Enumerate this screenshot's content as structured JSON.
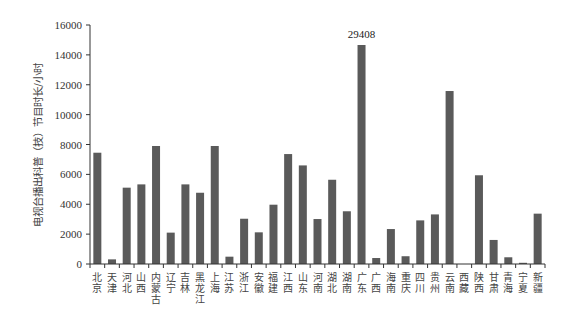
{
  "chart_data": {
    "type": "bar",
    "title": "",
    "xlabel": "",
    "ylabel": "电视台播出科普（技）节目时长/小时",
    "ylim": [
      0,
      16000
    ],
    "yticks": [
      0,
      2000,
      4000,
      6000,
      8000,
      10000,
      12000,
      14000,
      16000
    ],
    "grid": false,
    "legend": null,
    "categories": [
      "北京",
      "天津",
      "河北",
      "山西",
      "内蒙古",
      "辽宁",
      "吉林",
      "黑龙江",
      "上海",
      "江苏",
      "浙江",
      "安徽",
      "福建",
      "江西",
      "山东",
      "河南",
      "湖北",
      "湖南",
      "广东",
      "广西",
      "海南",
      "重庆",
      "四川",
      "贵州",
      "云南",
      "西藏",
      "陕西",
      "甘肃",
      "青海",
      "宁夏",
      "新疆"
    ],
    "values": [
      7450,
      310,
      5110,
      5330,
      7900,
      2100,
      5330,
      4770,
      7900,
      490,
      3030,
      2120,
      3970,
      7360,
      6600,
      3010,
      5640,
      3530,
      29408,
      400,
      2340,
      520,
      2920,
      3320,
      11580,
      0,
      5940,
      1610,
      450,
      80,
      3370
    ],
    "annotations": [
      {
        "category": "广东",
        "text": "29408",
        "note": "bar truncated at top of axis"
      }
    ],
    "bar_color": "#5a5a5a"
  }
}
